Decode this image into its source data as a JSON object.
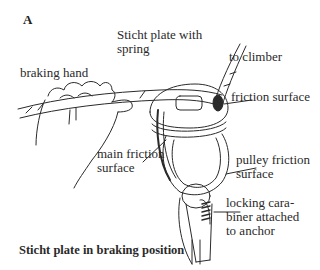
{
  "figure": {
    "panel_letter": "A",
    "caption": "Sticht plate in braking position",
    "labels": {
      "sticht_plate_line1": "Sticht plate with",
      "sticht_plate_line2": "spring",
      "to_climber": "to climber",
      "braking_hand": "braking hand",
      "friction_surface": "friction surface",
      "main_friction_line1": "main friction",
      "main_friction_line2": "surface",
      "pulley_friction_line1": "pulley friction",
      "pulley_friction_line2": "surface",
      "carabiner_line1": "locking cara-",
      "carabiner_line2": "biner attached",
      "carabiner_line3": "to anchor"
    },
    "colors": {
      "ink": "#2a2a2a",
      "background": "#ffffff"
    }
  }
}
